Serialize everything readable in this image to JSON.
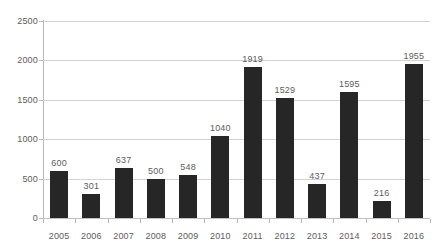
{
  "chart_data": {
    "type": "bar",
    "title": "",
    "subtitle": "",
    "xlabel": "",
    "ylabel": "",
    "categories": [
      "2005",
      "2006",
      "2007",
      "2008",
      "2009",
      "2010",
      "2011",
      "2012",
      "2013",
      "2014",
      "2015",
      "2016"
    ],
    "values": [
      600,
      301,
      637,
      500,
      548,
      1040,
      1919,
      1529,
      437,
      1595,
      216,
      1955
    ],
    "data_labels": [
      "600",
      "301",
      "637",
      "500",
      "548",
      "1040",
      "1919",
      "1529",
      "437",
      "1595",
      "216",
      "1955"
    ],
    "ylim": [
      0,
      2500
    ],
    "y_ticks": [
      0,
      500,
      1000,
      1500,
      2000,
      2500
    ],
    "y_tick_labels": [
      "0",
      "500",
      "1000",
      "1500",
      "2000",
      "2500"
    ],
    "grid": true,
    "grid_axis": "y",
    "legend": false,
    "legend_position": "none",
    "annotations": [],
    "colors": {
      "bar": "#262626",
      "gridline": "#d3d3d3",
      "axis": "#b7b7b7",
      "label_text": "#5c5c5c",
      "background": "#ffffff"
    }
  }
}
